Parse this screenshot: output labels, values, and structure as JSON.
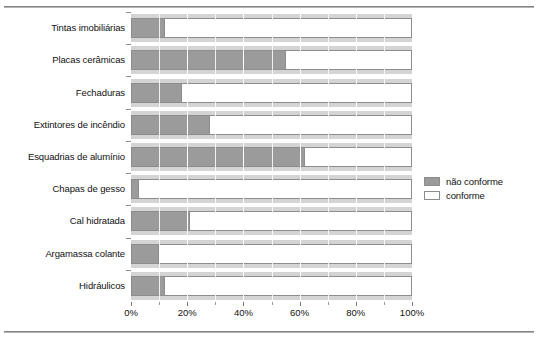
{
  "chart_data": {
    "type": "bar",
    "orientation": "horizontal",
    "stacked": true,
    "title": "",
    "xlabel": "",
    "ylabel": "",
    "xlim": [
      0,
      100
    ],
    "xticks": [
      "0%",
      "20%",
      "40%",
      "60%",
      "80%",
      "100%"
    ],
    "xtick_values": [
      0,
      20,
      40,
      60,
      80,
      100
    ],
    "minor_xtick_values": [
      10,
      30,
      50,
      70,
      90
    ],
    "grid": true,
    "legend_position": "right",
    "categories": [
      "Tintas imobiliárias",
      "Placas cerâmicas",
      "Fechaduras",
      "Extintores de incêndio",
      "Esquadrias de alumínio",
      "Chapas de gesso",
      "Cal hidratada",
      "Argamassa colante",
      "Hidráulicos"
    ],
    "series": [
      {
        "name": "não conforme",
        "color": "#9b9b9b",
        "values": [
          12,
          55,
          18,
          28,
          62,
          3,
          21,
          10,
          12
        ]
      },
      {
        "name": "conforme",
        "color": "#ffffff",
        "values": [
          88,
          45,
          82,
          72,
          38,
          97,
          79,
          90,
          88
        ]
      }
    ]
  },
  "legend": {
    "items": [
      {
        "label": "não conforme",
        "swatch": "filled-gray"
      },
      {
        "label": "conforme",
        "swatch": "outlined-white"
      }
    ]
  },
  "colors": {
    "bar_nao_conforme": "#9b9b9b",
    "bar_conforme": "#ffffff",
    "band_background": "#d4d4d4",
    "outline": "#8d8d8d",
    "rule": "#6e6e6e",
    "text": "#111111"
  }
}
